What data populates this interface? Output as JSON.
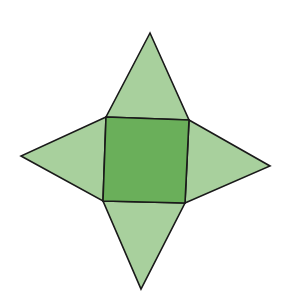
{
  "diagram": {
    "colors": {
      "base": "#6aaf5a",
      "lateral": "#a8d09d",
      "edge": "#1a1a1a",
      "background": "#ffffff"
    },
    "faces": [
      {
        "id": "base",
        "shape": "square"
      },
      {
        "id": "top",
        "shape": "triangle"
      },
      {
        "id": "right",
        "shape": "triangle"
      },
      {
        "id": "bottom",
        "shape": "triangle"
      },
      {
        "id": "left",
        "shape": "triangle"
      }
    ]
  }
}
